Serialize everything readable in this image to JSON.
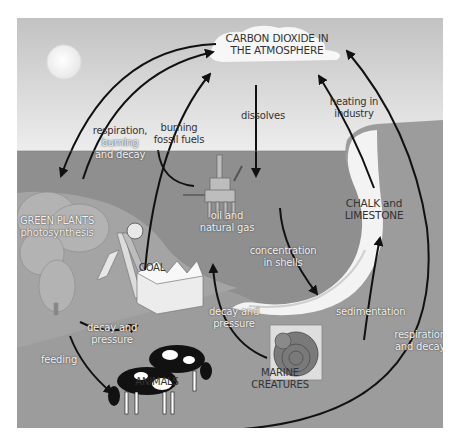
{
  "diagram": {
    "colors": {
      "sky_top": "#c4c4c4",
      "sky_bottom": "#ececec",
      "sea": "#8e8e8e",
      "land": "#9b9b9b",
      "cliff": "#f4f4f4",
      "arrow": "#111111",
      "sun": "#f7f7f7"
    },
    "nodes": {
      "atmosphere": {
        "line1": "CARBON DIOXIDE IN",
        "line2": "THE ATMOSPHERE"
      },
      "green_plants": {
        "line1": "GREEN PLANTS",
        "line2": "photosynthesis"
      },
      "coal": {
        "label": "COAL"
      },
      "oil_gas": {
        "line1": "oil and",
        "line2": "natural gas"
      },
      "chalk": {
        "line1": "CHALK and",
        "line2": "LIMESTONE"
      },
      "marine": {
        "line1": "MARINE",
        "line2": "CREATURES"
      },
      "animals": {
        "label": "ANIMALS"
      }
    },
    "processes": {
      "respiration_burning": {
        "line1": "respiration,",
        "line2": "burning",
        "line3": "and decay"
      },
      "burning_fossil": {
        "line1": "burning",
        "line2": "fossil fuels"
      },
      "dissolves": {
        "label": "dissolves"
      },
      "heating": {
        "line1": "heating in",
        "line2": "industry"
      },
      "concentration": {
        "line1": "concentration",
        "line2": "in shells"
      },
      "decay_pressure_left": {
        "line1": "decay and",
        "line2": "pressure"
      },
      "decay_pressure_right": {
        "line1": "decay and",
        "line2": "pressure"
      },
      "sedimentation": {
        "label": "sedimentation"
      },
      "feeding": {
        "label": "feeding"
      },
      "respiration_decay": {
        "line1": "respiration",
        "line2": "and decay"
      }
    }
  }
}
